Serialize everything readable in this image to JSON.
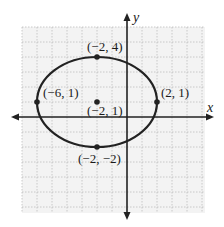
{
  "diagram": {
    "type": "ellipse-graph",
    "axes": {
      "x_label": "x",
      "y_label": "y"
    },
    "ellipse": {
      "center": [
        -2,
        1
      ],
      "semi_major_x": 4,
      "semi_minor_y": 3
    },
    "points": [
      {
        "name": "top-vertex",
        "coords": [
          -2,
          4
        ],
        "label": "(−2, 4)"
      },
      {
        "name": "left-vertex",
        "coords": [
          -6,
          1
        ],
        "label": "(−6, 1)"
      },
      {
        "name": "right-vertex",
        "coords": [
          2,
          1
        ],
        "label": "(2, 1)"
      },
      {
        "name": "bottom-vertex",
        "coords": [
          -2,
          -2
        ],
        "label": "(−2, −2)"
      },
      {
        "name": "center",
        "coords": [
          -2,
          1
        ],
        "label": "(−2, 1)"
      }
    ],
    "colors": {
      "grid": "#bdbdbd",
      "grid_bg": "#f3f3f3",
      "curve": "#222222",
      "axes": "#222222"
    }
  }
}
